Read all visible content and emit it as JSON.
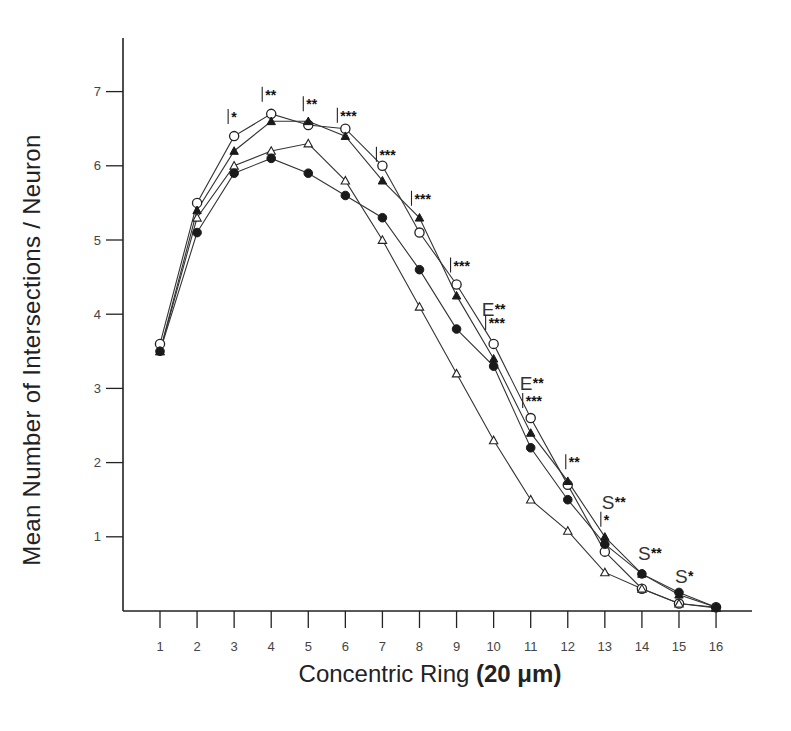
{
  "chart_data": {
    "type": "line",
    "title": "",
    "xlabel": "Concentric Ring",
    "xlabel_unit": "(20 μm)",
    "ylabel": "Mean Number of Intersections / Neuron",
    "x": [
      1,
      2,
      3,
      4,
      5,
      6,
      7,
      8,
      9,
      10,
      11,
      12,
      13,
      14,
      15,
      16
    ],
    "x_tick_labels": [
      "1",
      "2",
      "3",
      "4",
      "5",
      "6",
      "7",
      "8",
      "9",
      "10",
      "11",
      "12",
      "13",
      "14",
      "15",
      "16"
    ],
    "y_tick_labels": [
      "1",
      "2",
      "3",
      "4",
      "5",
      "6",
      "7"
    ],
    "xlim": [
      1,
      16
    ],
    "ylim": [
      0,
      7.5
    ],
    "grid": false,
    "legend": "none",
    "series": [
      {
        "name": "open-circle",
        "marker": "open-circle",
        "values": [
          3.6,
          5.5,
          6.4,
          6.7,
          6.55,
          6.5,
          6.0,
          5.1,
          4.4,
          3.6,
          2.6,
          1.7,
          0.8,
          0.3,
          0.1,
          0.05
        ]
      },
      {
        "name": "filled-triangle",
        "marker": "filled-triangle",
        "values": [
          3.5,
          5.4,
          6.2,
          6.6,
          6.6,
          6.4,
          5.8,
          5.3,
          4.25,
          3.4,
          2.4,
          1.75,
          1.0,
          0.5,
          0.22,
          0.05
        ]
      },
      {
        "name": "open-triangle",
        "marker": "open-triangle",
        "values": [
          3.5,
          5.3,
          6.0,
          6.2,
          6.3,
          5.8,
          5.0,
          4.1,
          3.2,
          2.3,
          1.5,
          1.08,
          0.52,
          0.3,
          0.1,
          0.04
        ]
      },
      {
        "name": "filled-circle",
        "marker": "filled-circle",
        "values": [
          3.5,
          5.1,
          5.9,
          6.1,
          5.9,
          5.6,
          5.3,
          4.6,
          3.8,
          3.3,
          2.2,
          1.5,
          0.9,
          0.5,
          0.25,
          0.05
        ]
      }
    ],
    "annotations": [
      {
        "x": 3,
        "y": 6.4,
        "text": "|*"
      },
      {
        "x": 4,
        "y": 6.7,
        "text": "|**"
      },
      {
        "x": 5,
        "y": 6.6,
        "text": "|**"
      },
      {
        "x": 6,
        "y": 6.5,
        "text": "|***"
      },
      {
        "x": 7,
        "y": 6.0,
        "text": "|***"
      },
      {
        "x": 8,
        "y": 5.3,
        "text": "|***"
      },
      {
        "x": 9,
        "y": 4.4,
        "text": "|***"
      },
      {
        "x": 10,
        "y": 4.0,
        "text": "E**"
      },
      {
        "x": 10,
        "y": 3.6,
        "text": "|***"
      },
      {
        "x": 11,
        "y": 3.0,
        "text": "E**"
      },
      {
        "x": 11,
        "y": 2.6,
        "text": "|***"
      },
      {
        "x": 12,
        "y": 1.75,
        "text": "|**"
      },
      {
        "x": 13,
        "y": 1.4,
        "text": "S**"
      },
      {
        "x": 13,
        "y": 1.0,
        "text": "|*"
      },
      {
        "x": 14,
        "y": 0.5,
        "text": "S**"
      },
      {
        "x": 15,
        "y": 0.22,
        "text": "S*"
      }
    ]
  },
  "labels": {
    "ylabel": "Mean Number of Intersections / Neuron",
    "xlabel_main": "Concentric Ring ",
    "xlabel_unit": "(20 μm)"
  }
}
